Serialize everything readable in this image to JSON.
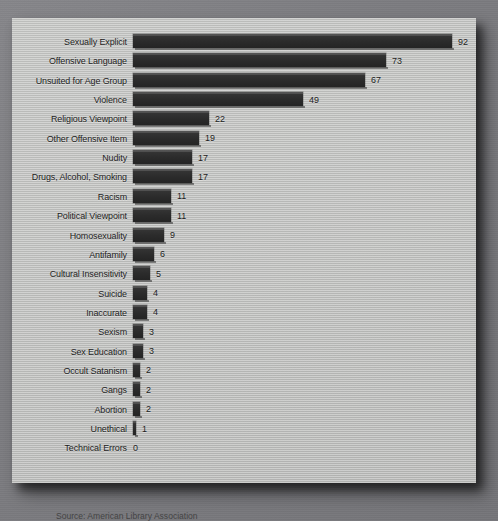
{
  "chart_data": {
    "type": "bar",
    "orientation": "horizontal",
    "title": "",
    "subtitle": "",
    "xlabel": "",
    "ylabel": "",
    "xlim": [
      0,
      95
    ],
    "grid": false,
    "legend": null,
    "categories": [
      "Sexually Explicit",
      "Offensive Language",
      "Unsuited for Age Group",
      "Violence",
      "Religious Viewpoint",
      "Other Offensive Item",
      "Nudity",
      "Drugs, Alcohol, Smoking",
      "Racism",
      "Political Viewpoint",
      "Homosexuality",
      "Antifamily",
      "Cultural Insensitivity",
      "Suicide",
      "Inaccurate",
      "Sexism",
      "Sex Education",
      "Occult Satanism",
      "Gangs",
      "Abortion",
      "Unethical",
      "Technical Errors"
    ],
    "values": [
      92,
      73,
      67,
      49,
      22,
      19,
      17,
      17,
      11,
      11,
      9,
      6,
      5,
      4,
      4,
      3,
      3,
      2,
      2,
      2,
      1,
      0
    ],
    "data_labels": [
      "92",
      "73",
      "67",
      "49",
      "22",
      "19",
      "17",
      "17",
      "11",
      "11",
      "9",
      "6",
      "5",
      "4",
      "4",
      "3",
      "3",
      "2",
      "2",
      "2",
      "1",
      "0"
    ]
  },
  "caption": {
    "source_text": "Source: American Library Association"
  },
  "colors": {
    "bar": "#2d2d2d",
    "panel_background": "#bebfbd",
    "page_background": "#7e7e80",
    "text": "#1d1d1d"
  }
}
